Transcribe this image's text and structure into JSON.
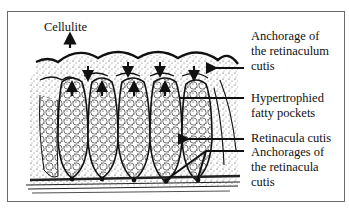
{
  "diagram": {
    "title_label": "Cellulite",
    "labels": [
      {
        "id": "anchorage-retinaculum",
        "lines": [
          "Anchorage of",
          "the retinaculum",
          "cutis"
        ]
      },
      {
        "id": "fatty-pockets",
        "lines": [
          "Hypertrophied",
          "fatty pockets"
        ]
      },
      {
        "id": "retinacula-cutis",
        "lines": [
          "Retinacula cutis"
        ]
      },
      {
        "id": "anchorages-retinacula",
        "lines": [
          "Anchorages of",
          "the retinacula",
          "cutis"
        ]
      }
    ],
    "colors": {
      "ink": "#111111",
      "frame": "#6a6a6a",
      "background": "#ffffff"
    }
  }
}
